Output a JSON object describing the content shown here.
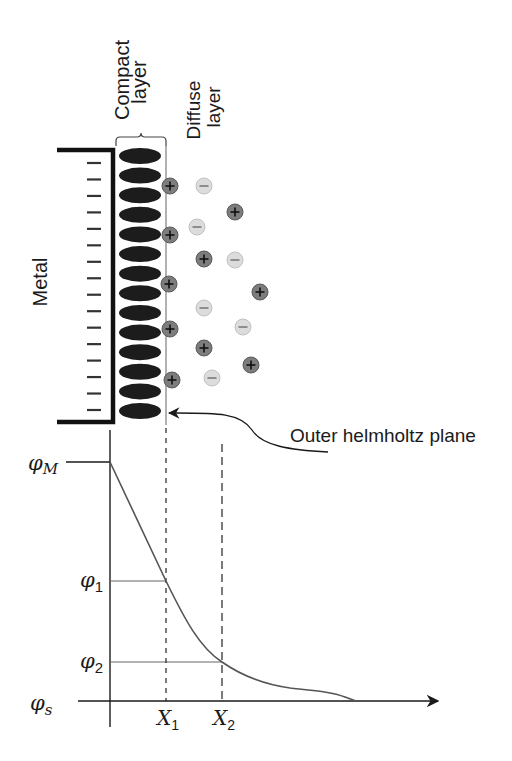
{
  "labels": {
    "metal": "Metal",
    "compact_layer_line1": "Compact",
    "compact_layer_line2": "layer",
    "diffuse_layer_line1": "Diffuse",
    "diffuse_layer_line2": "layer",
    "outer_helmholtz_plane": "Outer helmholtz plane"
  },
  "structure": {
    "metal_surface_charges": 16,
    "metal_charge_symbol": "−",
    "compact_layer_molecules": 14,
    "positive_ion_symbol": "+",
    "negative_ion_symbol": "−",
    "ions": [
      {
        "sign": "+",
        "x": 170,
        "y": 186
      },
      {
        "sign": "−",
        "x": 204,
        "y": 186
      },
      {
        "sign": "+",
        "x": 235,
        "y": 212
      },
      {
        "sign": "−",
        "x": 197,
        "y": 227
      },
      {
        "sign": "+",
        "x": 170,
        "y": 235
      },
      {
        "sign": "+",
        "x": 204,
        "y": 259
      },
      {
        "sign": "−",
        "x": 235,
        "y": 260
      },
      {
        "sign": "+",
        "x": 169,
        "y": 284
      },
      {
        "sign": "+",
        "x": 260,
        "y": 292
      },
      {
        "sign": "−",
        "x": 204,
        "y": 308
      },
      {
        "sign": "−",
        "x": 243,
        "y": 327
      },
      {
        "sign": "+",
        "x": 170,
        "y": 329
      },
      {
        "sign": "+",
        "x": 204,
        "y": 348
      },
      {
        "sign": "+",
        "x": 251,
        "y": 365
      },
      {
        "sign": "−",
        "x": 212,
        "y": 378
      },
      {
        "sign": "+",
        "x": 172,
        "y": 380
      }
    ]
  },
  "plot": {
    "y_labels": {
      "phi_M": {
        "symbol": "φ",
        "sub": "M"
      },
      "phi_1": {
        "symbol": "φ",
        "sub": "1"
      },
      "phi_2": {
        "symbol": "φ",
        "sub": "2"
      },
      "phi_s": {
        "symbol": "φ",
        "sub": "s"
      }
    },
    "x_labels": {
      "x1": {
        "symbol": "X",
        "sub": "1"
      },
      "x2": {
        "symbol": "X",
        "sub": "2"
      }
    }
  },
  "chart_data": {
    "type": "line",
    "xlabel": "",
    "ylabel": "",
    "x_ticks": [
      "X1",
      "X2"
    ],
    "y_ticks": [
      "φM",
      "φ1",
      "φ2",
      "φs"
    ],
    "series": [
      {
        "name": "potential φ(x)",
        "points_desc": "linear drop from φM at x=0 to φ1 at X1, then exponential-like decay to φ2 at X2, approaching φs asymptotically",
        "x": [
          0,
          1,
          2,
          3,
          4.4
        ],
        "y": [
          1.0,
          0.5,
          0.16,
          0.05,
          0.0
        ]
      }
    ],
    "grid": false,
    "legend": "none"
  },
  "colors": {
    "ink": "#1a1a1a",
    "molecule": "#1c1c1c",
    "positive_ion_fill": "#7d7d7d",
    "negative_ion_fill": "#dcdcdc",
    "curve": "#555555"
  }
}
